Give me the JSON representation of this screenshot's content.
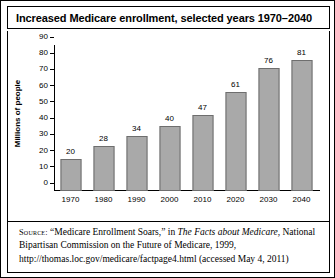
{
  "figure": {
    "title": "Increased Medicare enrollment, selected years 1970–2040"
  },
  "chart_data": {
    "type": "bar",
    "title": "Increased Medicare enrollment, selected years 1970–2040",
    "xlabel": "",
    "ylabel": "Millions of people",
    "categories": [
      "1970",
      "1980",
      "1990",
      "2000",
      "2010",
      "2020",
      "2030",
      "2040"
    ],
    "values": [
      20,
      28,
      34,
      40,
      47,
      61,
      76,
      81
    ],
    "value_labels": [
      "20",
      "28",
      "34",
      "40",
      "47",
      "61",
      "76",
      "81"
    ],
    "ylim": [
      0,
      90
    ],
    "yticks": [
      0,
      10,
      20,
      30,
      40,
      50,
      60,
      70,
      80,
      90
    ],
    "ytick_labels": [
      "0",
      "10",
      "20",
      "30",
      "40",
      "50",
      "60",
      "70",
      "80",
      "90"
    ],
    "grid": false,
    "legend": false,
    "bar_color": "#a9a9a9",
    "bar_edge_color": "#6e6e6e",
    "axis_color": "#000000"
  },
  "source": {
    "label": "Source:",
    "part1": " “Medicare Enrollment Soars,” in ",
    "italic_title": "The Facts about Medicare",
    "part2": ", National Bipartisan Commission on the Future of Medicare, 1999, http://thomas.loc.gov/medicare/factpage4.html (accessed May 4, 2011)"
  }
}
